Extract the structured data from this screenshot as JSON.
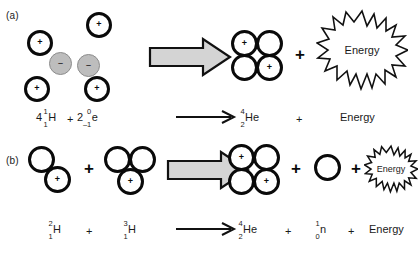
{
  "figure": {
    "background_color": "#ffffff",
    "ink_color": "#0a0a0a",
    "arrow_fill": "#d4d4d4",
    "electron_fill": "#bdbdbd"
  },
  "panels": [
    {
      "id": "a",
      "label": "(a)",
      "reactants_pictorial": {
        "protons": 4,
        "electrons": 2,
        "proton_symbol": "+",
        "electron_symbol": "–"
      },
      "products_pictorial": {
        "helium_nucleus": {
          "protons": 2,
          "neutrons": 2,
          "proton_symbol": "+"
        },
        "plus": "+",
        "energy_label": "Energy"
      },
      "equation": {
        "reactants": [
          {
            "coefficient": "4",
            "mass": "1",
            "atomic": "1",
            "symbol": "H"
          },
          {
            "coefficient": "2",
            "mass": "0",
            "atomic": "–1",
            "symbol": "e"
          }
        ],
        "reactant_plus": "+",
        "arrow": "→",
        "products": [
          {
            "coefficient": "",
            "mass": "4",
            "atomic": "2",
            "symbol": "He"
          }
        ],
        "product_plus": "+",
        "energy_label": "Energy"
      }
    },
    {
      "id": "b",
      "label": "(b)",
      "reactants_pictorial": {
        "deuterium": {
          "protons": 1,
          "neutrons": 1,
          "proton_symbol": "+"
        },
        "tritium": {
          "protons": 1,
          "neutrons": 2,
          "proton_symbol": "+"
        },
        "plus": "+"
      },
      "products_pictorial": {
        "helium_nucleus": {
          "protons": 2,
          "neutrons": 2,
          "proton_symbol": "+"
        },
        "plus_1": "+",
        "neutron": {
          "neutrons": 1
        },
        "plus_2": "+",
        "energy_label": "Energy"
      },
      "equation": {
        "reactants": [
          {
            "coefficient": "",
            "mass": "2",
            "atomic": "1",
            "symbol": "H"
          },
          {
            "coefficient": "",
            "mass": "3",
            "atomic": "1",
            "symbol": "H"
          }
        ],
        "reactant_plus": "+",
        "arrow": "→",
        "products": [
          {
            "coefficient": "",
            "mass": "4",
            "atomic": "2",
            "symbol": "He"
          },
          {
            "coefficient": "",
            "mass": "1",
            "atomic": "0",
            "symbol": "n"
          }
        ],
        "product_plus_1": "+",
        "product_plus_2": "+",
        "energy_label": "Energy"
      }
    }
  ]
}
